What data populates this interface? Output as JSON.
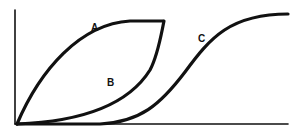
{
  "diagram": {
    "type": "curves-on-axes",
    "curves": [
      {
        "id": "A",
        "label": "A",
        "shape": "concave rising, from origin to plateau"
      },
      {
        "id": "B",
        "label": "B",
        "shape": "convex rising, from origin meeting A at top"
      },
      {
        "id": "C",
        "label": "C",
        "shape": "sigmoid, shifted right"
      }
    ],
    "axes": {
      "x_label": "",
      "y_label": ""
    },
    "colors": {
      "stroke": "#111111",
      "background": "#ffffff"
    }
  }
}
